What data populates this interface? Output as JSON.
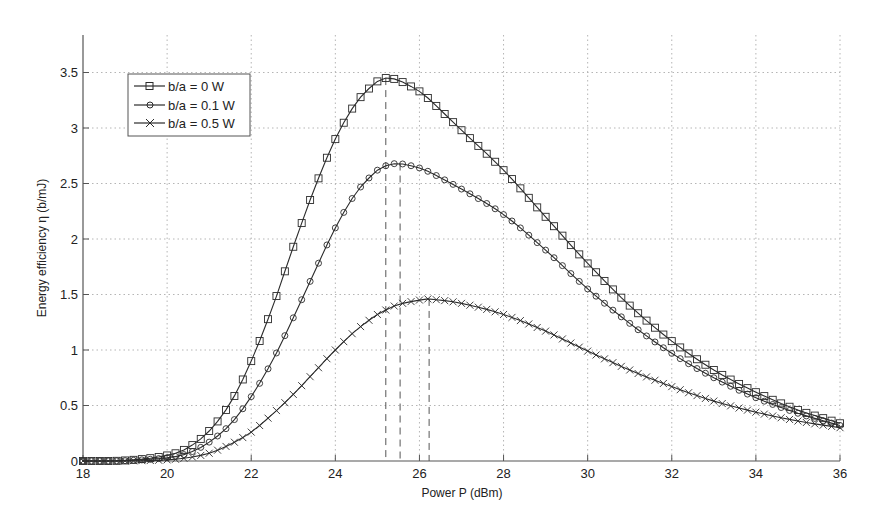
{
  "chart_data": {
    "type": "line",
    "title": "",
    "xlabel": "Power P (dBm)",
    "ylabel": "Energy efficiency η (b/mJ)",
    "xlim": [
      18,
      36
    ],
    "ylim": [
      0,
      3.75
    ],
    "xticks": [
      18,
      20,
      22,
      24,
      26,
      28,
      30,
      32,
      34,
      36
    ],
    "yticks": [
      0,
      0.5,
      1,
      1.5,
      2,
      2.5,
      3,
      3.5
    ],
    "ytick_labels": [
      "0",
      "0.5",
      "1",
      "1.5",
      "2",
      "2.5",
      "3",
      "3.5"
    ],
    "grid": true,
    "legend_position": "upper left",
    "marker_step": 0.2,
    "x": [
      18,
      19,
      20,
      20.5,
      21,
      21.5,
      22,
      22.5,
      23,
      23.5,
      24,
      24.5,
      25,
      25.2,
      25.5,
      26,
      26.2,
      27,
      28,
      29,
      30,
      31,
      32,
      33,
      34,
      35,
      36
    ],
    "series": [
      {
        "name": "b/a = 0 W",
        "marker": "square",
        "values": [
          0,
          0.005,
          0.05,
          0.12,
          0.27,
          0.52,
          0.9,
          1.38,
          1.93,
          2.45,
          2.9,
          3.23,
          3.42,
          3.45,
          3.43,
          3.33,
          3.27,
          2.98,
          2.62,
          2.2,
          1.78,
          1.4,
          1.08,
          0.82,
          0.62,
          0.46,
          0.34
        ]
      },
      {
        "name": "b/a = 0.1 W",
        "marker": "circle",
        "values": [
          0,
          0.003,
          0.03,
          0.07,
          0.17,
          0.33,
          0.58,
          0.9,
          1.29,
          1.7,
          2.1,
          2.42,
          2.62,
          2.66,
          2.68,
          2.64,
          2.61,
          2.45,
          2.22,
          1.9,
          1.55,
          1.24,
          0.97,
          0.75,
          0.57,
          0.43,
          0.32
        ]
      },
      {
        "name": "b/a = 0.5 W",
        "marker": "x",
        "values": [
          0,
          0.001,
          0.01,
          0.03,
          0.07,
          0.15,
          0.26,
          0.42,
          0.6,
          0.8,
          1.0,
          1.18,
          1.32,
          1.36,
          1.41,
          1.45,
          1.46,
          1.42,
          1.32,
          1.17,
          0.99,
          0.82,
          0.67,
          0.54,
          0.44,
          0.36,
          0.3
        ]
      }
    ],
    "annotations": [
      {
        "type": "vertical-dashed",
        "x": 25.2,
        "y_top": 3.45,
        "series": "b/a = 0 W"
      },
      {
        "type": "vertical-dashed",
        "x": 25.54,
        "y_top": 2.68,
        "series": "b/a = 0.1 W"
      },
      {
        "type": "vertical-dashed",
        "x": 26.23,
        "y_top": 1.46,
        "series": "b/a = 0.5 W"
      }
    ],
    "colors": {
      "line": "#2b2b2b",
      "grid": "#b5b5b5",
      "axis": "#555555"
    }
  },
  "legend": {
    "items": [
      "b/a = 0 W",
      "b/a = 0.1 W",
      "b/a = 0.5 W"
    ]
  },
  "axes": {
    "xlabel": "Power P (dBm)",
    "ylabel": "Energy efficiency η (b/mJ)"
  }
}
